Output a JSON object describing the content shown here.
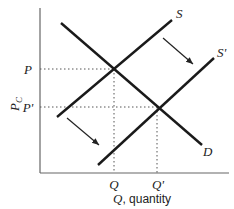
{
  "diagram": {
    "y_axis_label": "P",
    "y_axis_label_sub": "C",
    "x_axis_label_var": "Q",
    "x_axis_label_text": ", quantity",
    "curves": [
      {
        "name": "S",
        "label": "S"
      },
      {
        "name": "S'",
        "label": "S'"
      },
      {
        "name": "D",
        "label": "D"
      }
    ],
    "price_ticks": [
      {
        "label": "P"
      },
      {
        "label": "P'"
      }
    ],
    "quantity_ticks": [
      {
        "label": "Q"
      },
      {
        "label": "Q'"
      }
    ],
    "arrows": [
      "supply-shift-arrow-upper",
      "supply-shift-arrow-lower"
    ],
    "colors": {
      "line": "#1a1a1a",
      "axis": "#555555",
      "guide": "#555555"
    }
  }
}
